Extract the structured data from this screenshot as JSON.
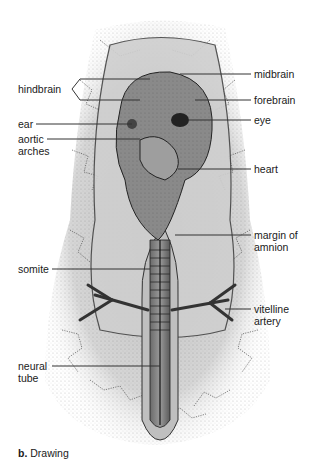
{
  "figure": {
    "caption_prefix": "b.",
    "caption_text": "Drawing",
    "labels_left": [
      {
        "id": "hindbrain",
        "text": "hindbrain"
      },
      {
        "id": "ear",
        "text": "ear"
      },
      {
        "id": "aortic-arches",
        "text": "aortic",
        "text2": "arches"
      },
      {
        "id": "somite",
        "text": "somite"
      },
      {
        "id": "neural-tube",
        "text": "neural",
        "text2": "tube"
      }
    ],
    "labels_right": [
      {
        "id": "midbrain",
        "text": "midbrain"
      },
      {
        "id": "forebrain",
        "text": "forebrain"
      },
      {
        "id": "eye",
        "text": "eye"
      },
      {
        "id": "heart",
        "text": "heart"
      },
      {
        "id": "margin-of-amnion",
        "text": "margin of",
        "text2": "amnion"
      },
      {
        "id": "vitelline-artery",
        "text": "vitelline",
        "text2": "artery"
      }
    ]
  }
}
